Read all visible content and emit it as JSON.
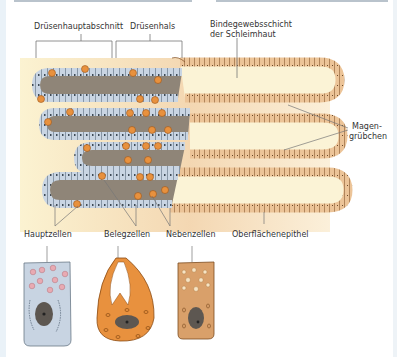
{
  "diagram": {
    "top_labels": {
      "druesenhauptabschnitt": "Drüsenhauptabschnitt",
      "druesenhals": "Drüsenhals",
      "bindegewebsschicht_line1": "Bindegewebsschicht",
      "bindegewebsschicht_line2": "der Schleimhaut"
    },
    "right_labels": {
      "magen_line1": "Magen-",
      "magen_line2": "grübchen"
    },
    "bottom_labels": {
      "hauptzellen": "Hauptzellen",
      "belegzellen": "Belegzellen",
      "nebenzellen": "Nebenzellen",
      "oberflaechenepithel": "Oberflächenepithel"
    },
    "colors": {
      "connective_tissue": "#f3dcb9",
      "pit_lumen": "#fbf3d6",
      "epithel_cells": "#e9b98a",
      "gland_lumen": "#8f8578",
      "chief_cells": "#c8d4e2",
      "parietal_cells": "#e8913e",
      "mucous_neck_cells": "#d9a06a",
      "nucleus": "#5d5751"
    }
  }
}
